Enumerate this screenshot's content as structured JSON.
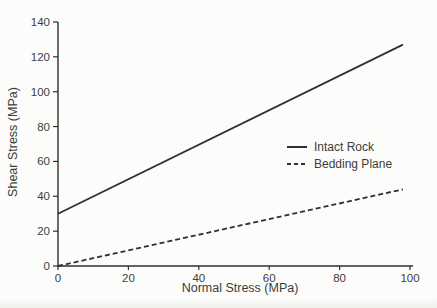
{
  "figure": {
    "background_color": "#fcfcfa",
    "line_color": "#303030",
    "text_color": "#3c3c3c"
  },
  "chart_data": {
    "type": "line",
    "title": "",
    "xlabel": "Normal Stress (MPa)",
    "ylabel": "Shear Stress (MPa)",
    "xlim": [
      0,
      100
    ],
    "ylim": [
      0,
      140
    ],
    "x_ticks": [
      0,
      20,
      40,
      60,
      80,
      100
    ],
    "y_ticks": [
      0,
      20,
      40,
      60,
      80,
      100,
      120,
      140
    ],
    "grid": false,
    "legend_position": "inside-right-center",
    "series": [
      {
        "name": "Intact Rock",
        "line_style": "solid",
        "color": "#303030",
        "points": [
          [
            0,
            30
          ],
          [
            98,
            127
          ]
        ]
      },
      {
        "name": "Bedding Plane",
        "line_style": "dashed",
        "color": "#303030",
        "points": [
          [
            0,
            0
          ],
          [
            98,
            44
          ]
        ]
      }
    ]
  }
}
